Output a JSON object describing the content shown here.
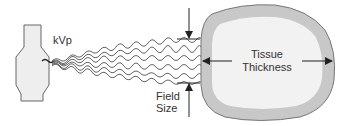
{
  "diagram": {
    "labels": {
      "kvp": "kVp",
      "field_size_line1": "Field",
      "field_size_line2": "Size",
      "tissue_line1": "Tissue",
      "tissue_line2": "Thickness"
    },
    "colors": {
      "outline": "#666666",
      "tube_fill": "#eeeeee",
      "tissue_outer": "#c8c8c8",
      "tissue_inner": "#f2f2f2",
      "waves": "#555555",
      "arrows": "#222222"
    },
    "elements": [
      "x-ray-tube",
      "x-ray-beam",
      "field-size-indicator",
      "tissue-cross-section",
      "tissue-thickness-indicator"
    ]
  }
}
